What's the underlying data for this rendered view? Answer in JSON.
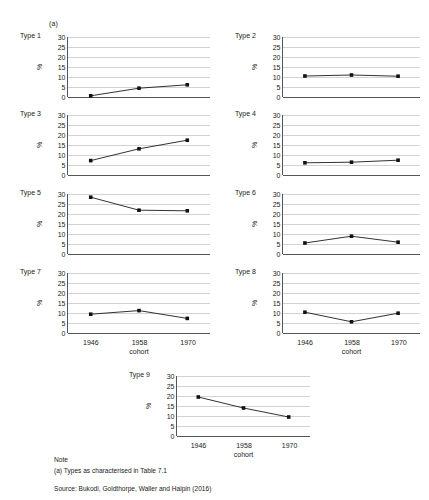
{
  "figure": {
    "annotation": "(a)",
    "y_axis_label": "%",
    "x_axis_label": "cohort",
    "y_ticks": [
      0,
      5,
      10,
      15,
      20,
      25,
      30
    ],
    "x_ticks": [
      "1946",
      "1958",
      "1970"
    ],
    "footer": {
      "note_heading": "Note",
      "note_a": "(a) Types as characterised in Table 7.1",
      "source": "Source: Bukodi, Goldthorpe, Waller and Halpin (2016)"
    }
  },
  "chart_data": {
    "type": "line",
    "title": "",
    "subtitle": "(a)",
    "xlabel": "cohort",
    "ylabel": "%",
    "ylim": [
      0,
      30
    ],
    "yticks": [
      0,
      5,
      10,
      15,
      20,
      25,
      30
    ],
    "grid": true,
    "legend": "none",
    "categories": [
      "1946",
      "1958",
      "1970"
    ],
    "panels": [
      {
        "name": "Type 1",
        "values": [
          0.6,
          4.4,
          6.1
        ]
      },
      {
        "name": "Type 2",
        "values": [
          10.5,
          11.0,
          10.4
        ]
      },
      {
        "name": "Type 3",
        "values": [
          7.2,
          13.1,
          17.4
        ]
      },
      {
        "name": "Type 4",
        "values": [
          6.1,
          6.4,
          7.4
        ]
      },
      {
        "name": "Type 5",
        "values": [
          28.4,
          21.9,
          21.6
        ]
      },
      {
        "name": "Type 6",
        "values": [
          5.5,
          8.9,
          5.9
        ]
      },
      {
        "name": "Type 7",
        "values": [
          9.4,
          11.2,
          7.3
        ]
      },
      {
        "name": "Type 8",
        "values": [
          10.4,
          5.6,
          9.9
        ]
      },
      {
        "name": "Type 9",
        "values": [
          19.5,
          14.0,
          9.5
        ]
      }
    ],
    "annotations": [
      "Note",
      "(a) Types as characterised in Table 7.1",
      "Source: Bukodi, Goldthorpe, Waller and Halpin (2016)"
    ]
  }
}
